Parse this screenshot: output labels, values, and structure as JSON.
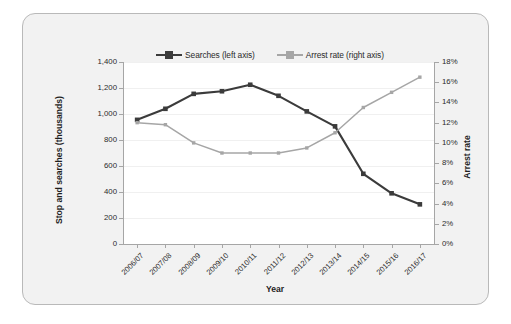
{
  "chart_data": {
    "type": "line",
    "title": "",
    "xlabel": "Year",
    "ylabel": "Stop and searches (thousands)",
    "ylabel_right": "Arrest rate",
    "categories": [
      "2006/07",
      "2007/08",
      "2008/09",
      "2009/10",
      "2010/11",
      "2011/12",
      "2012/13",
      "2013/14",
      "2014/15",
      "2015/16",
      "2016/17"
    ],
    "series": [
      {
        "name": "Searches (left axis)",
        "axis": "left",
        "color": "#3b3b3b",
        "marker": "square",
        "values": [
          955,
          1040,
          1155,
          1175,
          1225,
          1140,
          1020,
          905,
          540,
          390,
          305
        ]
      },
      {
        "name": "Arrest rate (right axis)",
        "axis": "right",
        "color": "#a6a6a6",
        "marker": "square",
        "values": [
          12.0,
          11.8,
          10.0,
          9.0,
          9.0,
          9.0,
          9.5,
          11.0,
          13.5,
          15.0,
          16.5
        ]
      }
    ],
    "ylim": [
      0,
      1400
    ],
    "ylim_right": [
      0,
      18
    ],
    "yticks": [
      "0",
      "200",
      "400",
      "600",
      "800",
      "1,000",
      "1,200",
      "1,400"
    ],
    "yticks_right": [
      "0%",
      "2%",
      "4%",
      "6%",
      "8%",
      "10%",
      "12%",
      "14%",
      "16%",
      "18%"
    ],
    "grid": true,
    "legend_position": "top"
  },
  "legend": {
    "entries": [
      {
        "label": "Searches (left axis)"
      },
      {
        "label": "Arrest rate (right axis)"
      }
    ]
  },
  "colors": {
    "searches": "#3b3b3b",
    "arrest_rate": "#a6a6a6",
    "frame_bg": "#f2f2f2",
    "frame_border": "#b9b9b9",
    "plot_bg": "#ffffff",
    "axis": "#a6a6a6",
    "gridline": "#f0f0f0"
  }
}
